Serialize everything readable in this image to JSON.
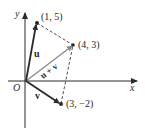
{
  "diagram": {
    "axes": {
      "x_label": "x",
      "y_label": "y",
      "origin_label": "O"
    },
    "points": [
      {
        "id": "p1",
        "label": "(1, 5)"
      },
      {
        "id": "p2",
        "label": "(4, 3)"
      },
      {
        "id": "p3",
        "label": "(3, −2)"
      }
    ],
    "vectors": [
      {
        "id": "u",
        "label": "u",
        "from": "O",
        "to": "(1, 5)"
      },
      {
        "id": "v",
        "label": "v",
        "from": "O",
        "to": "(3, −2)"
      },
      {
        "id": "u_plus_v",
        "label": "u + v",
        "from": "O",
        "to": "(4, 3)"
      }
    ],
    "colors": {
      "ink": "#2a2a2a",
      "diagonal": "#8a8a8a",
      "dashed": "#3a3a3a"
    }
  }
}
